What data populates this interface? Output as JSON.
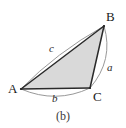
{
  "figure": {
    "caption": "(b)",
    "background_color": "#ffffff",
    "fill_color": "#d9d9d9",
    "edge_color": "#2a2a2a",
    "arc_color": "#8c8c8c"
  },
  "vertices": [
    {
      "name": "A",
      "label": "A",
      "x": 21,
      "y": 89
    },
    {
      "name": "B",
      "label": "B",
      "x": 104,
      "y": 26
    },
    {
      "name": "C",
      "label": "C",
      "x": 90,
      "y": 88
    }
  ],
  "vertex_labels": [
    {
      "name": "A",
      "label": "A",
      "left": 8,
      "top": 83
    },
    {
      "name": "B",
      "label": "B",
      "left": 105,
      "top": 11
    },
    {
      "name": "C",
      "label": "C",
      "left": 93,
      "top": 91
    }
  ],
  "sides": [
    {
      "name": "a",
      "label": "a",
      "between": "B-C",
      "left": 106,
      "top": 62
    },
    {
      "name": "b",
      "label": "b",
      "between": "A-C",
      "left": 51,
      "top": 93
    },
    {
      "name": "c",
      "label": "c",
      "between": "A-B",
      "left": 49,
      "top": 43
    }
  ],
  "geometry": {
    "triangle_path": "M 21 89 L 104 26 L 90 88 Z",
    "arc_c_path": "M 21 89 Q 56 53 104 26",
    "arc_b_path": "M 21 89 Q 56 103 90 88",
    "arc_a_path": "M 104 26 Q 112 62 90 88"
  }
}
